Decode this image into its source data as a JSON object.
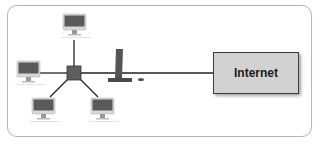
{
  "diagram": {
    "type": "star-network-topology",
    "nodes": {
      "hub": {
        "name": "hub",
        "x": 74,
        "y": 73
      },
      "computers": [
        {
          "name": "computer-top",
          "x": 75,
          "y": 25
        },
        {
          "name": "computer-left",
          "x": 29,
          "y": 72
        },
        {
          "name": "computer-bottom-left",
          "x": 43,
          "y": 110
        },
        {
          "name": "computer-bottom-right",
          "x": 103,
          "y": 110
        }
      ],
      "router": {
        "name": "router-tower",
        "x": 119,
        "y": 67
      },
      "internet": {
        "label": "Internet"
      }
    },
    "colors": {
      "frame_border": "#b5b5b5",
      "line": "#222222",
      "hub": "#5e5e5e",
      "monitor_screen": "#5a5a5a",
      "internet_fill": "#d2d2d2",
      "internet_border": "#3c3c3c"
    }
  }
}
